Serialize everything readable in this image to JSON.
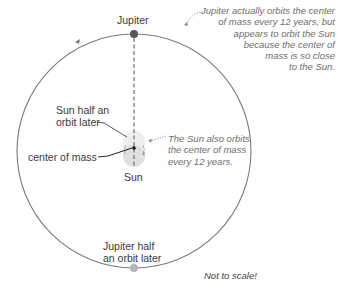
{
  "labels": {
    "jupiter": "Jupiter",
    "sun_half_orbit": [
      "Sun half an",
      "orbit later"
    ],
    "center_of_mass": "center of mass",
    "sun": "Sun",
    "jupiter_half_orbit": [
      "Jupiter half",
      "an orbit later"
    ],
    "not_to_scale": "Not to scale!"
  },
  "notes": {
    "jupiter_orbit": [
      "Jupiter actually orbits the center",
      "of mass every 12 years, but",
      "appears to orbit the Sun",
      "because the center of",
      "mass is so close",
      "to the Sun."
    ],
    "sun_orbit": [
      "The Sun also orbits",
      "the center of mass",
      "every 12 years."
    ]
  },
  "colors": {
    "orbit": "#7a7a7a",
    "jupiter": "#555555",
    "jupiter_later": "#b5b5b5",
    "sun": "#e2e2e2",
    "sun_later": "#eeeeee",
    "text": "#3a3a3a",
    "note_text": "#6e6e6e"
  }
}
